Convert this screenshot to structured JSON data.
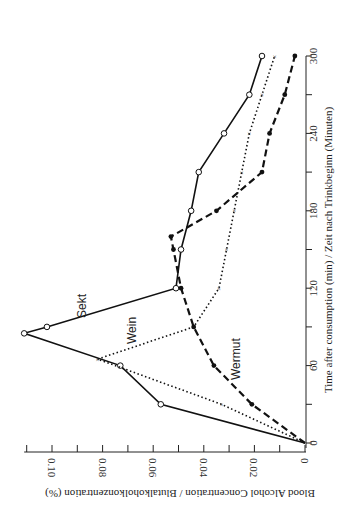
{
  "chart_data": {
    "type": "line",
    "orientation": "rotated-90",
    "xlabel": "Time after consumption (min) / Zeit nach Trinkbeginn (Minuten)",
    "ylabel": "Blood Alcohol Concentration / Blutalkoholkonzentration (%)",
    "xlim": [
      0,
      300
    ],
    "ylim": [
      0,
      0.11
    ],
    "x_ticks": [
      0,
      60,
      120,
      180,
      240,
      300
    ],
    "y_ticks": [
      "0",
      "0.02",
      "0.04",
      "0.06",
      "0.08",
      "0.10"
    ],
    "series": [
      {
        "name": "Sekt",
        "marker": "open-circle",
        "line": "solid",
        "x": [
          0,
          30,
          60,
          85,
          90,
          120,
          150,
          180,
          210,
          240,
          270,
          300
        ],
        "y": [
          0,
          0.057,
          0.073,
          0.111,
          0.102,
          0.051,
          0.049,
          0.045,
          0.042,
          0.032,
          0.022,
          0.017
        ]
      },
      {
        "name": "Wein",
        "marker": "x",
        "line": "dotted",
        "x": [
          0,
          30,
          65,
          90,
          120,
          150,
          180,
          210,
          240,
          270,
          300
        ],
        "y": [
          0,
          0.033,
          0.082,
          0.044,
          0.034,
          0.031,
          0.028,
          0.025,
          0.022,
          0.017,
          0.012
        ]
      },
      {
        "name": "Wermut",
        "marker": "filled-circle",
        "line": "dashed",
        "x": [
          0,
          30,
          60,
          90,
          120,
          150,
          160,
          180,
          210,
          240,
          270,
          300
        ],
        "y": [
          0,
          0.021,
          0.036,
          0.044,
          0.049,
          0.052,
          0.053,
          0.035,
          0.017,
          0.014,
          0.008,
          0.004
        ]
      }
    ]
  }
}
